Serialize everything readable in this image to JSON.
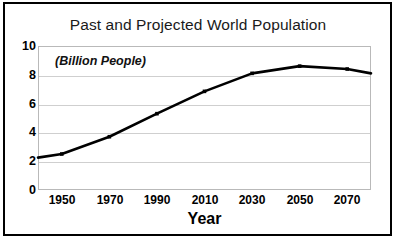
{
  "chart_data": {
    "type": "line",
    "title": "Past and Projected World Population",
    "annotation": "(Billion People)",
    "xlabel": "Year",
    "ylabel": "",
    "xlim": [
      1940,
      2080
    ],
    "ylim": [
      0,
      10
    ],
    "grid": true,
    "legend": "none",
    "x_ticks": [
      "1950",
      "1970",
      "1990",
      "2010",
      "2030",
      "2050",
      "2070"
    ],
    "y_ticks": [
      "0",
      "2",
      "4",
      "6",
      "8",
      "10"
    ],
    "series": [
      {
        "name": "World Population",
        "color": "#000000",
        "x": [
          1940,
          1950,
          1970,
          1990,
          2010,
          2030,
          2050,
          2070,
          2080
        ],
        "values": [
          2.25,
          2.5,
          3.7,
          5.3,
          6.85,
          8.1,
          8.6,
          8.4,
          8.1
        ]
      }
    ]
  },
  "axis": {
    "y_ticks": [
      {
        "label": "10",
        "value": 10
      },
      {
        "label": "8",
        "value": 8
      },
      {
        "label": "6",
        "value": 6
      },
      {
        "label": "4",
        "value": 4
      },
      {
        "label": "2",
        "value": 2
      },
      {
        "label": "0",
        "value": 0
      }
    ],
    "x_ticks": [
      {
        "label": "1950",
        "value": 1950
      },
      {
        "label": "1970",
        "value": 1970
      },
      {
        "label": "1990",
        "value": 1990
      },
      {
        "label": "2010",
        "value": 2010
      },
      {
        "label": "2030",
        "value": 2030
      },
      {
        "label": "2050",
        "value": 2050
      },
      {
        "label": "2070",
        "value": 2070
      }
    ]
  },
  "colors": {
    "line": "#000000",
    "grid": "#cfcfcf",
    "plot_border": "#b9b9b9",
    "frame": "#000000",
    "text": "#000000",
    "background": "#ffffff"
  }
}
